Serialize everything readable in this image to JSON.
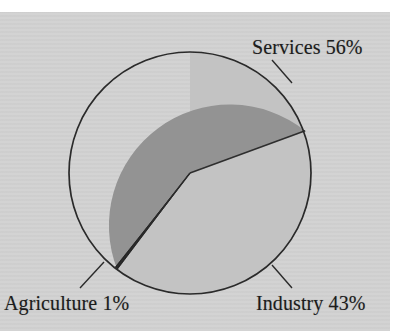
{
  "figure": {
    "background_color": "#d2d2d2",
    "page_color": "#ffffff",
    "outline_color": "#2a2a2a"
  },
  "chart_data": {
    "type": "pie",
    "title": "",
    "subtitle": "",
    "xlabel": "",
    "ylabel": "",
    "grid": false,
    "legend_position": "none",
    "labels_style": "callout-with-leader-lines",
    "categories": [
      "Services",
      "Industry",
      "Agriculture"
    ],
    "values": [
      56,
      43,
      1
    ],
    "unit": "%",
    "slices": [
      {
        "name": "Services",
        "value": 56,
        "label": "Services 56%",
        "color": "#c3c3c3",
        "label_position": "top-right",
        "start_angle_deg": 269,
        "end_angle_deg": 470
      },
      {
        "name": "Industry",
        "value": 43,
        "label": "Industry 43%",
        "color": "#939393",
        "label_position": "bottom-right",
        "start_angle_deg": 115,
        "end_angle_deg": 270
      },
      {
        "name": "Agriculture",
        "value": 1,
        "label": "Agriculture 1%",
        "color": "#1f1f1f",
        "label_position": "bottom-left",
        "start_angle_deg": 111,
        "end_angle_deg": 115
      }
    ],
    "geometry": {
      "center_x": 190,
      "center_y": 173,
      "radius": 121
    }
  },
  "labels": {
    "services": "Services 56%",
    "industry": "Industry 43%",
    "agriculture": "Agriculture 1%"
  }
}
